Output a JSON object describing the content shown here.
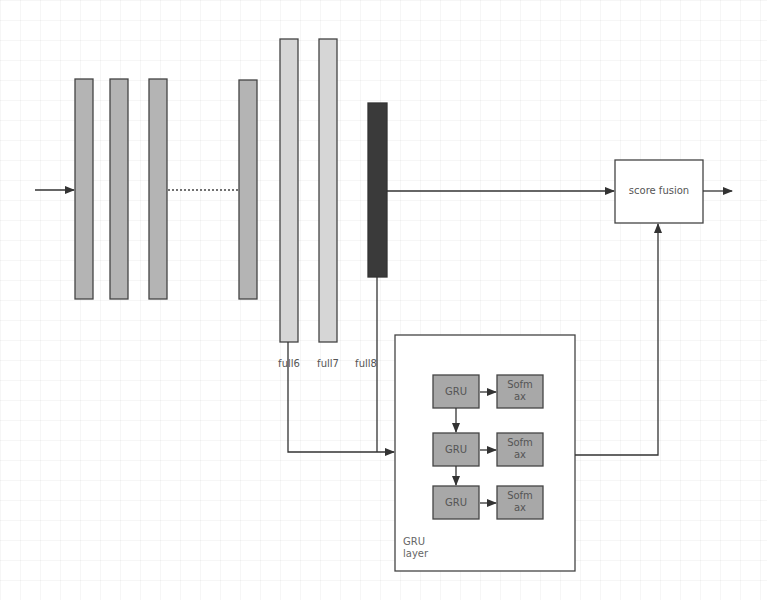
{
  "diagram": {
    "type": "neural-network-architecture",
    "colors": {
      "conv_layer": "#b4b4b4",
      "fc_layer": "#d6d6d6",
      "output_layer": "#3a3a3a",
      "gru_cell": "#a8a8a8",
      "stroke": "#444444",
      "text": "#555555"
    },
    "layers": {
      "conv": [
        {
          "id": "conv1"
        },
        {
          "id": "conv2"
        },
        {
          "id": "conv3"
        },
        {
          "id": "conv_last"
        }
      ],
      "fc": [
        {
          "id": "full6",
          "label": "full6"
        },
        {
          "id": "full7",
          "label": "full7"
        },
        {
          "id": "full8",
          "label": "full8"
        }
      ]
    },
    "score_fusion": {
      "label": "score fusion"
    },
    "gru_layer": {
      "label_line1": "GRU",
      "label_line2": "layer",
      "rows": [
        {
          "gru": "GRU",
          "softmax_line1": "Sofm",
          "softmax_line2": "ax"
        },
        {
          "gru": "GRU",
          "softmax_line1": "Sofm",
          "softmax_line2": "ax"
        },
        {
          "gru": "GRU",
          "softmax_line1": "Sofm",
          "softmax_line2": "ax"
        }
      ]
    },
    "edges": [
      {
        "from": "input",
        "to": "conv1"
      },
      {
        "from": "conv3",
        "to": "conv_last",
        "style": "dotted"
      },
      {
        "from": "full8",
        "to": "score_fusion"
      },
      {
        "from": "full6",
        "to": "gru_layer"
      },
      {
        "from": "full8",
        "to": "gru_layer"
      },
      {
        "from": "gru_layer",
        "to": "score_fusion"
      },
      {
        "from": "score_fusion",
        "to": "output"
      },
      {
        "from": "gru_row_1",
        "to": "gru_row_2"
      },
      {
        "from": "gru_row_2",
        "to": "gru_row_3"
      },
      {
        "from": "gru",
        "to": "softmax"
      }
    ]
  }
}
